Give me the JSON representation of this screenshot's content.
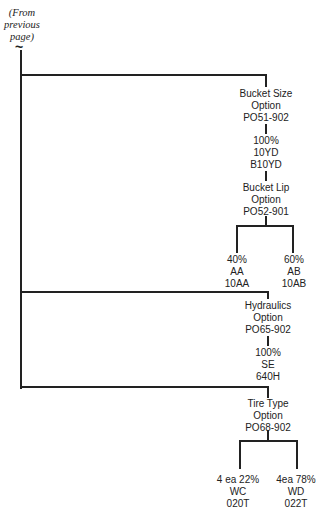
{
  "continuation_note": {
    "lines": [
      "(From",
      "previous",
      "page)"
    ],
    "symbol": "~"
  },
  "nodes": {
    "bucket_size": {
      "lines": [
        "Bucket Size",
        "Option",
        "PO51-902"
      ]
    },
    "bucket_size_choice": {
      "lines": [
        "100%",
        "10YD",
        "B10YD"
      ]
    },
    "bucket_lip": {
      "lines": [
        "Bucket Lip",
        "Option",
        "PO52-901"
      ]
    },
    "bucket_lip_choices": [
      {
        "lines": [
          "40%",
          "AA",
          "10AA"
        ]
      },
      {
        "lines": [
          "60%",
          "AB",
          "10AB"
        ]
      }
    ],
    "hydraulics": {
      "lines": [
        "Hydraulics",
        "Option",
        "PO65-902"
      ]
    },
    "hydraulics_choice": {
      "lines": [
        "100%",
        "SE",
        "640H"
      ]
    },
    "tire_type": {
      "lines": [
        "Tire Type",
        "Option",
        "PO68-902"
      ]
    },
    "tire_type_choices": [
      {
        "lines": [
          "4 ea 22%",
          "WC",
          "020T"
        ]
      },
      {
        "lines": [
          "4ea 78%",
          "WD",
          "022T"
        ]
      }
    ]
  },
  "colors": {
    "line": "#222222",
    "background": "#ffffff"
  }
}
